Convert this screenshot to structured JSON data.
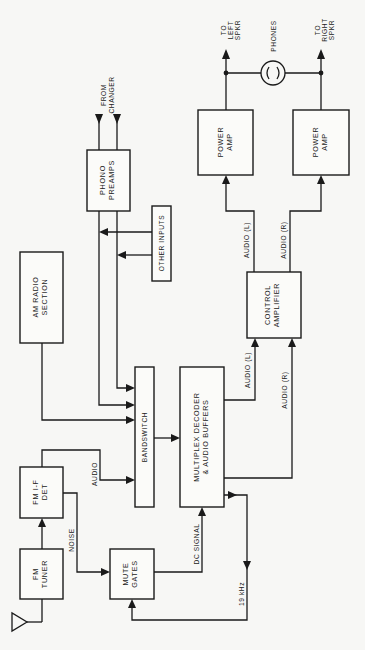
{
  "diagram": {
    "type": "block diagram",
    "orientation": "rotated 90deg counter-clockwise",
    "blocks": {
      "fm_tuner": {
        "line1": "FM",
        "line2": "TUNER"
      },
      "fm_if_det": {
        "line1": "FM I-F",
        "line2": "DET"
      },
      "mute_gates": {
        "line1": "MUTE",
        "line2": "GATES"
      },
      "am_radio": {
        "line1": "AM RADIO",
        "line2": "SECTION"
      },
      "bandswitch": {
        "line1": "BANDSWITCH"
      },
      "multiplex": {
        "line1": "MULTIPLEX DECODER",
        "line2": "& AUDIO BUFFERS"
      },
      "phono_preamps": {
        "line1": "PHONO",
        "line2": "PREAMPS"
      },
      "other_inputs": {
        "line1": "OTHER INPUTS"
      },
      "control_amp": {
        "line1": "CONTROL",
        "line2": "AMPLIFIER"
      },
      "power_amp_left": {
        "line1": "POWER",
        "line2": "AMP"
      },
      "power_amp_right": {
        "line1": "POWER",
        "line2": "AMP"
      }
    },
    "signals": {
      "noise": "NOISE",
      "audio_fm": "AUDIO",
      "dc_signal": "DC SIGNAL",
      "pilot": "19 kHz",
      "mpx_audio_l": "AUDIO (L)",
      "mpx_audio_r": "AUDIO (R)",
      "ctrl_audio_l": "AUDIO (L)",
      "ctrl_audio_r": "AUDIO (R)"
    },
    "terminals": {
      "from_changer_1": "FROM",
      "from_changer_2": "CHANGER",
      "left_spkr_1": "TO",
      "left_spkr_2": "LEFT",
      "left_spkr_3": "SPKR",
      "right_spkr_1": "TO",
      "right_spkr_2": "RIGHT",
      "right_spkr_3": "SPKR",
      "phones": "PHONES"
    },
    "connections": [
      [
        "antenna",
        "fm_tuner"
      ],
      [
        "fm_tuner",
        "fm_if_det"
      ],
      [
        "fm_if_det",
        "bandswitch",
        "AUDIO"
      ],
      [
        "fm_if_det",
        "mute_gates",
        "NOISE"
      ],
      [
        "mute_gates",
        "multiplex",
        "DC SIGNAL"
      ],
      [
        "multiplex",
        "mute_gates",
        "19 kHz"
      ],
      [
        "am_radio",
        "bandswitch"
      ],
      [
        "changer",
        "phono_preamps"
      ],
      [
        "phono_preamps",
        "bandswitch"
      ],
      [
        "other_inputs",
        "bandswitch"
      ],
      [
        "bandswitch",
        "multiplex"
      ],
      [
        "multiplex",
        "control_amp",
        "AUDIO (L)"
      ],
      [
        "multiplex",
        "control_amp",
        "AUDIO (R)"
      ],
      [
        "control_amp",
        "power_amp_left",
        "AUDIO (L)"
      ],
      [
        "control_amp",
        "power_amp_right",
        "AUDIO (R)"
      ],
      [
        "power_amp_left",
        "left_speaker"
      ],
      [
        "power_amp_right",
        "right_speaker"
      ],
      [
        "power_amp_left",
        "phones"
      ],
      [
        "power_amp_right",
        "phones"
      ]
    ]
  }
}
